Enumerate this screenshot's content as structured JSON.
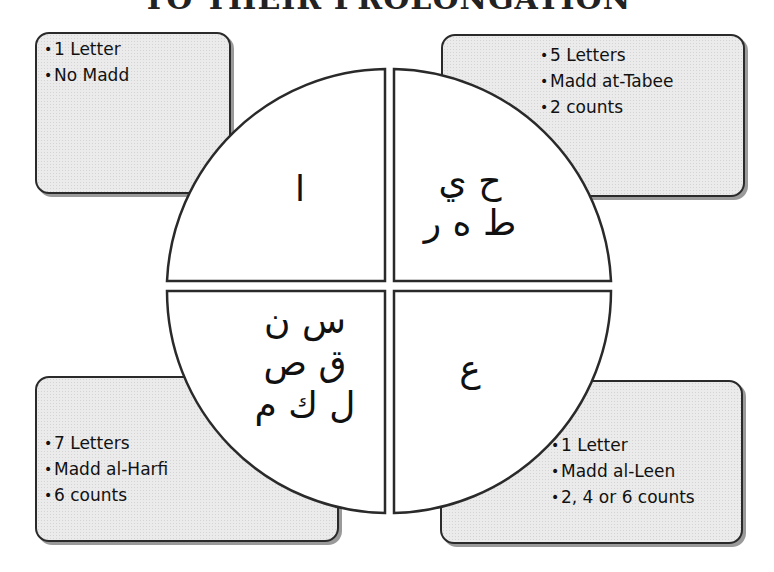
{
  "title": "TO THEIR PROLONGATION",
  "wheel": {
    "center": [
      389,
      291
    ],
    "radius": 222,
    "fill": "#ffffff",
    "stroke": "#2a2a2a"
  },
  "quadrants": {
    "top_left": {
      "letters": "ا",
      "info": [
        "1 Letter",
        "No Madd"
      ]
    },
    "top_right": {
      "letters_line1": "ح ي",
      "letters_line2": "ط ه ر",
      "info": [
        "5 Letters",
        "Madd at-Tabee",
        "2 counts"
      ]
    },
    "bottom_left": {
      "letters_line1": "س ن",
      "letters_line2": "ق ص",
      "letters_line3": "ل ك م",
      "info": [
        "7 Letters",
        "Madd al-Harfi",
        "6 counts"
      ]
    },
    "bottom_right": {
      "letters": "ع",
      "info": [
        "1 Letter",
        "Madd al-Leen",
        "2, 4 or 6 counts"
      ]
    }
  },
  "bullet_symbol": "•",
  "colors": {
    "box_fill": "#ebebeb",
    "box_border": "#2a2a2a",
    "text": "#111111"
  }
}
